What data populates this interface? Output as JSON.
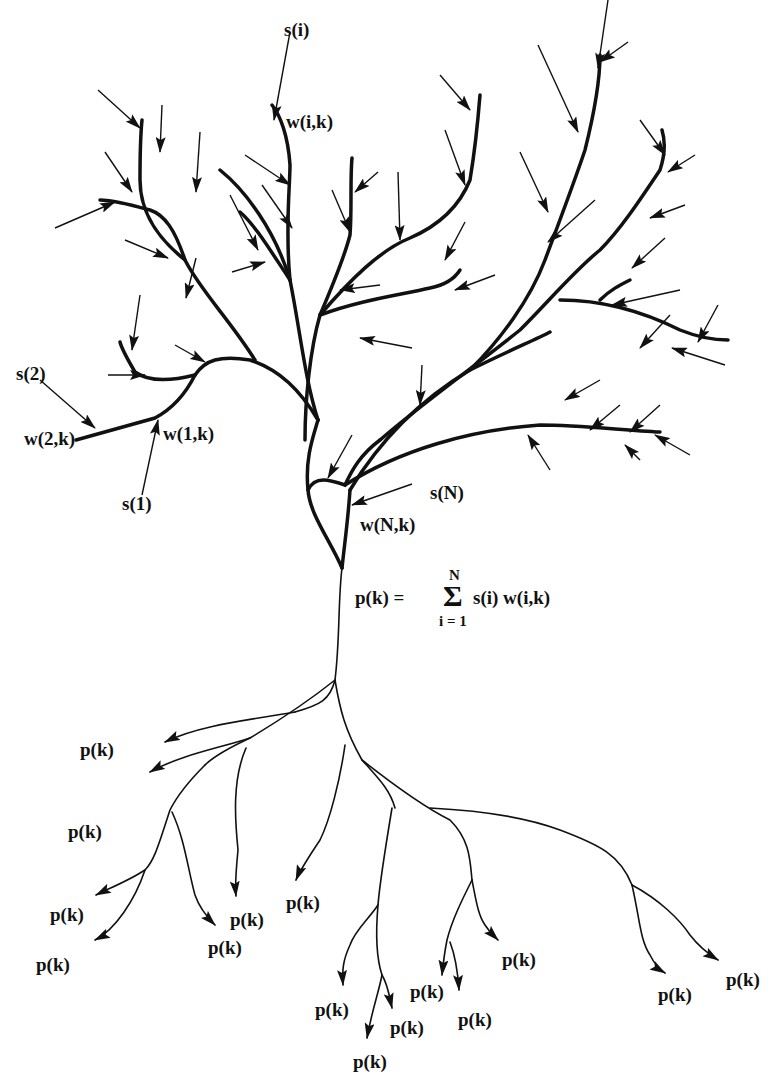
{
  "diagram": {
    "input_labels": {
      "s_i": "s(i)",
      "w_i_k": "w(i,k)",
      "s_2": "s(2)",
      "w_2_k": "w(2,k)",
      "w_1_k": "w(1,k)",
      "s_1": "s(1)",
      "s_N": "s(N)",
      "w_N_k": "w(N,k)"
    },
    "formula": {
      "lhs": "p(k) =",
      "sigma": "Σ",
      "upper": "N",
      "lower": "i = 1",
      "rhs": "s(i) w(i,k)"
    },
    "outputs": [
      {
        "label": "p(k)",
        "x": 80,
        "y": 740
      },
      {
        "label": "p(k)",
        "x": 68,
        "y": 822
      },
      {
        "label": "p(k)",
        "x": 50,
        "y": 905
      },
      {
        "label": "p(k)",
        "x": 36,
        "y": 955
      },
      {
        "label": "p(k)",
        "x": 230,
        "y": 910
      },
      {
        "label": "p(k)",
        "x": 208,
        "y": 938
      },
      {
        "label": "p(k)",
        "x": 286,
        "y": 893
      },
      {
        "label": "p(k)",
        "x": 315,
        "y": 1000
      },
      {
        "label": "p(k)",
        "x": 390,
        "y": 1018
      },
      {
        "label": "p(k)",
        "x": 353,
        "y": 1052
      },
      {
        "label": "p(k)",
        "x": 410,
        "y": 982
      },
      {
        "label": "p(k)",
        "x": 458,
        "y": 1010
      },
      {
        "label": "p(k)",
        "x": 502,
        "y": 950
      },
      {
        "label": "p(k)",
        "x": 658,
        "y": 985
      },
      {
        "label": "p(k)",
        "x": 726,
        "y": 970
      }
    ]
  }
}
